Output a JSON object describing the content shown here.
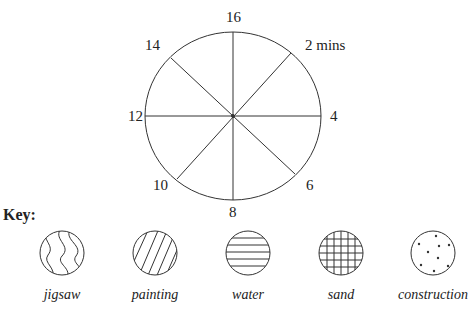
{
  "clock": {
    "labels": {
      "top": "16",
      "top_right": "2 mins",
      "right": "4",
      "bottom_right": "6",
      "bottom": "8",
      "bottom_left": "10",
      "left": "12",
      "top_left": "14"
    }
  },
  "key": {
    "title": "Key:",
    "items": [
      {
        "label": "jigsaw",
        "pattern": "wavy-lines"
      },
      {
        "label": "painting",
        "pattern": "diagonal-lines"
      },
      {
        "label": "water",
        "pattern": "horizontal-lines"
      },
      {
        "label": "sand",
        "pattern": "grid"
      },
      {
        "label": "construction",
        "pattern": "dots"
      }
    ]
  }
}
